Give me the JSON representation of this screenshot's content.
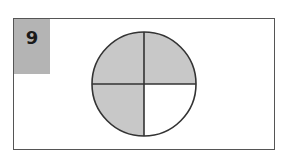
{
  "question_number": "9",
  "figure": {
    "shape": "circle",
    "total_parts": 4,
    "shaded_parts": 3,
    "shaded_quadrants": [
      "top-left",
      "top-right",
      "bottom-left"
    ],
    "unshaded_quadrants": [
      "bottom-right"
    ],
    "colors": {
      "shaded": "#c8c8c8",
      "unshaded": "#ffffff",
      "outline": "#333333",
      "label_background": "#b4b4b4"
    }
  }
}
